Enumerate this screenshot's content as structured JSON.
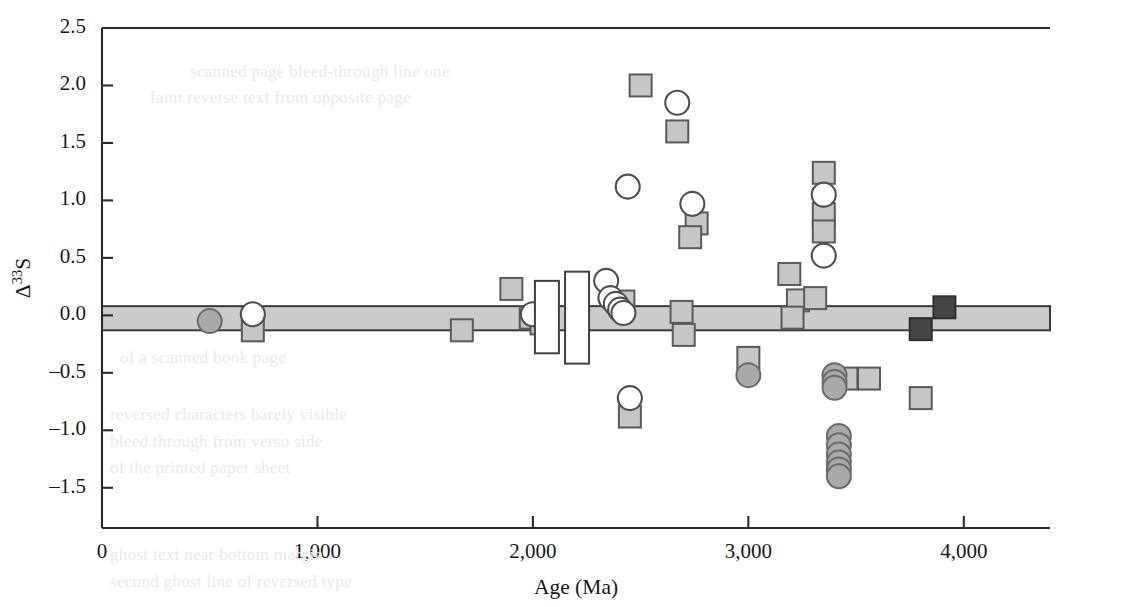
{
  "figure": {
    "background": "#ffffff",
    "frame_color": "#2b2b2b"
  },
  "chart_data": {
    "type": "scatter",
    "title": "",
    "xlabel": "Age (Ma)",
    "ylabel": "Δ33S",
    "ylabel_base": "Δ",
    "ylabel_sup": "33",
    "ylabel_tail": "S",
    "xlim": [
      0,
      4400
    ],
    "ylim": [
      -1.85,
      2.5
    ],
    "grid": false,
    "legend": "none",
    "xticks": [
      0,
      1000,
      2000,
      3000,
      4000
    ],
    "xticklabels": [
      "0",
      "1,000",
      "2,000",
      "3,000",
      "4,000"
    ],
    "yticks": [
      2.5,
      2.0,
      1.5,
      1.0,
      0.5,
      0.0,
      -0.5,
      -1.0,
      -1.5
    ],
    "yticklabels": [
      "2.5",
      "2.0",
      "1.5",
      "1.0",
      "0.5",
      "0.0",
      "–0.5",
      "–1.0",
      "–1.5"
    ],
    "reference_band": {
      "label": "mass-dependent fractionation band",
      "y_top": 0.08,
      "y_bottom": -0.13,
      "color": "#cbcbcb"
    },
    "series": [
      {
        "name": "gray-square",
        "marker": "square",
        "fill": "#c6c6c6",
        "edge": "#5a5a5a",
        "size": 22,
        "points": [
          [
            700,
            -0.13
          ],
          [
            1670,
            -0.13
          ],
          [
            1900,
            0.23
          ],
          [
            1990,
            -0.02
          ],
          [
            2040,
            -0.07
          ],
          [
            2500,
            2.0
          ],
          [
            2450,
            -0.88
          ],
          [
            2420,
            0.12
          ],
          [
            2670,
            1.6
          ],
          [
            2690,
            0.03
          ],
          [
            2700,
            -0.17
          ],
          [
            2760,
            0.8
          ],
          [
            2730,
            0.68
          ],
          [
            3000,
            -0.37
          ],
          [
            3190,
            0.36
          ],
          [
            3230,
            0.13
          ],
          [
            3205,
            -0.02
          ],
          [
            3350,
            1.24
          ],
          [
            3350,
            0.88
          ],
          [
            3350,
            0.73
          ],
          [
            3310,
            0.15
          ],
          [
            3455,
            -0.55
          ],
          [
            3560,
            -0.55
          ],
          [
            3800,
            -0.72
          ]
        ]
      },
      {
        "name": "dark-square",
        "marker": "square",
        "fill": "#444444",
        "edge": "#2e2e2e",
        "size": 22,
        "points": [
          [
            3800,
            -0.12
          ],
          [
            3910,
            0.07
          ]
        ]
      },
      {
        "name": "open-circle",
        "marker": "circle",
        "fill": "#ffffff",
        "edge": "#4f4f4f",
        "size": 24,
        "points": [
          [
            700,
            0.01
          ],
          [
            2000,
            0.01
          ],
          [
            2340,
            0.3
          ],
          [
            2360,
            0.15
          ],
          [
            2385,
            0.1
          ],
          [
            2405,
            0.05
          ],
          [
            2420,
            0.02
          ],
          [
            2440,
            1.12
          ],
          [
            2450,
            -0.72
          ],
          [
            2670,
            1.85
          ],
          [
            2740,
            0.97
          ],
          [
            3350,
            1.05
          ],
          [
            3350,
            0.52
          ]
        ]
      },
      {
        "name": "gray-circle",
        "marker": "circle",
        "fill": "#a9a9a9",
        "edge": "#6a6a6a",
        "size": 24,
        "points": [
          [
            500,
            -0.05
          ],
          [
            3000,
            -0.52
          ],
          [
            3400,
            -0.52
          ],
          [
            3400,
            -0.58
          ],
          [
            3400,
            -0.63
          ],
          [
            3420,
            -1.05
          ],
          [
            3420,
            -1.13
          ],
          [
            3420,
            -1.21
          ],
          [
            3420,
            -1.28
          ],
          [
            3420,
            -1.34
          ],
          [
            3420,
            -1.4
          ]
        ]
      },
      {
        "name": "open-range-box",
        "marker": "rect",
        "fill": "#ffffff",
        "edge": "#3f3f3f",
        "points": [
          [
            2065,
            0.3,
            -0.33
          ],
          [
            2205,
            0.38,
            -0.42
          ]
        ]
      }
    ]
  },
  "background_text": [
    {
      "text": "scanned page bleed-through line one",
      "x": 190,
      "y": 62
    },
    {
      "text": "faint reverse text from opposite page",
      "x": 150,
      "y": 88
    },
    {
      "text": "of   a   scanned   book   page",
      "x": 120,
      "y": 348
    },
    {
      "text": "reversed characters barely visible",
      "x": 110,
      "y": 405
    },
    {
      "text": "bleed through from verso side",
      "x": 110,
      "y": 432
    },
    {
      "text": "of the printed paper sheet",
      "x": 110,
      "y": 458
    },
    {
      "text": "ghost text near bottom margin",
      "x": 110,
      "y": 545
    },
    {
      "text": "second ghost line of reversed type",
      "x": 110,
      "y": 572
    }
  ]
}
